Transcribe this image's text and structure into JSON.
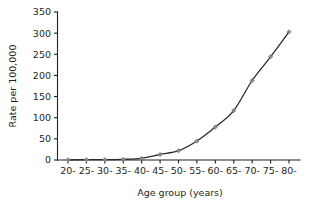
{
  "chart_data": {
    "type": "line",
    "title": "",
    "xlabel": "Age group (years)",
    "ylabel": "Rate per 100,000",
    "categories": [
      "20-",
      "25-",
      "30-",
      "35-",
      "40-",
      "45-",
      "50-",
      "55-",
      "60-",
      "65-",
      "70-",
      "75-",
      "80-"
    ],
    "values": [
      0.5,
      0.7,
      1,
      1.5,
      4,
      13,
      22,
      45,
      78,
      117,
      188,
      244,
      303
    ],
    "series": [
      {
        "name": "Rate per 100,000",
        "values": [
          0.5,
          0.7,
          1,
          1.5,
          4,
          13,
          22,
          45,
          78,
          117,
          188,
          244,
          303
        ]
      }
    ],
    "ylim": [
      0,
      350
    ],
    "yticks": [
      0,
      50,
      100,
      150,
      200,
      250,
      300,
      350
    ],
    "ytick_labels": [
      "0",
      "50",
      "100",
      "150",
      "200",
      "250",
      "300",
      "350"
    ],
    "xtick_labels": [
      "20-",
      "25-",
      "30-",
      "35-",
      "40-",
      "45-",
      "50-",
      "55-",
      "60-",
      "65-",
      "70-",
      "75-",
      "80-"
    ],
    "grid": false,
    "legend": false,
    "legend_position": "none",
    "marker": "diamond",
    "line_color": "#2b2b2b",
    "marker_color": "#8a8a8a",
    "background_color": "#ffffff"
  }
}
